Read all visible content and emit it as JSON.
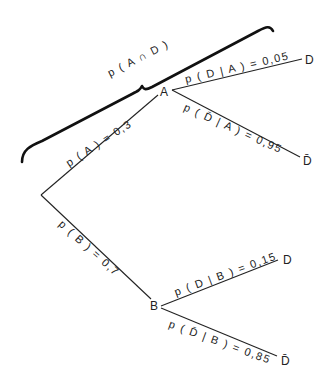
{
  "diagram": {
    "type": "probability-tree",
    "brace_label": "p ( A ∩ D )",
    "root": {
      "branches": [
        {
          "node": "A",
          "edge_label": "p ( A ) = 0,3",
          "value": 0.3,
          "children": [
            {
              "outcome": "D",
              "edge_label": "p ( D | A ) = 0,05",
              "value": 0.05
            },
            {
              "outcome": "D̄",
              "edge_label": "p ( D̄ | A ) = 0,95",
              "value": 0.95
            }
          ]
        },
        {
          "node": "B",
          "edge_label": "p ( B ) = 0,7",
          "value": 0.7,
          "children": [
            {
              "outcome": "D",
              "edge_label": "p ( D | B ) = 0,15",
              "value": 0.15
            },
            {
              "outcome": "D̄",
              "edge_label": "p ( D̄ | B ) = 0,85",
              "value": 0.85
            }
          ]
        }
      ]
    }
  }
}
